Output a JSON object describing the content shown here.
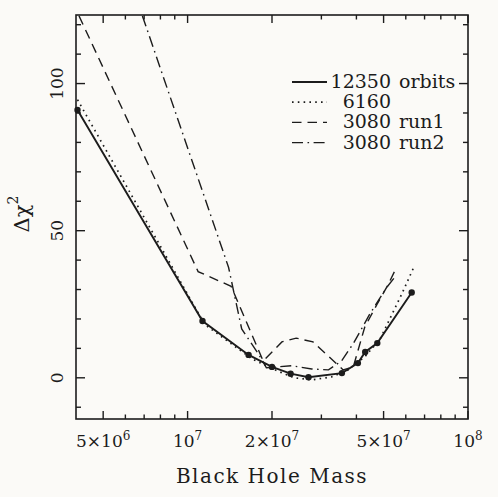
{
  "figure": {
    "background": "#fbfaf7",
    "ink": "#1c1c1c",
    "width": 498,
    "height": 497
  },
  "chart_data": {
    "type": "line",
    "title": "",
    "xlabel": "Black Hole Mass",
    "ylabel": "Δχ^2",
    "x_scale": "log",
    "y_scale": "linear",
    "xlim": [
      4000000,
      100000000
    ],
    "ylim": [
      -14,
      123.3
    ],
    "grid": false,
    "legend_position": "top-right",
    "x_ticks": [
      {
        "v": 5000000,
        "label": "5×10^6"
      },
      {
        "v": 6000000,
        "label": ""
      },
      {
        "v": 7000000,
        "label": ""
      },
      {
        "v": 8000000,
        "label": ""
      },
      {
        "v": 9000000,
        "label": ""
      },
      {
        "v": 10000000,
        "label": "10^7"
      },
      {
        "v": 20000000,
        "label": "2×10^7"
      },
      {
        "v": 30000000,
        "label": ""
      },
      {
        "v": 40000000,
        "label": ""
      },
      {
        "v": 50000000,
        "label": "5×10^7"
      },
      {
        "v": 60000000,
        "label": ""
      },
      {
        "v": 70000000,
        "label": ""
      },
      {
        "v": 80000000,
        "label": ""
      },
      {
        "v": 90000000,
        "label": ""
      },
      {
        "v": 100000000,
        "label": "10^8"
      }
    ],
    "y_ticks_major": [
      {
        "v": 0,
        "label": "0"
      },
      {
        "v": 50,
        "label": "50"
      },
      {
        "v": 100,
        "label": "100"
      }
    ],
    "y_ticks_minor": [
      -10,
      10,
      20,
      30,
      40,
      60,
      70,
      80,
      90,
      110,
      120
    ],
    "series": [
      {
        "name": "12350 orbits",
        "legend_num": "12350",
        "legend_suffix": "orbits",
        "style": "solid",
        "marker": "circle",
        "x": [
          4050000,
          11300000,
          16500000,
          20000000,
          23300000,
          27000000,
          35500000,
          40500000,
          43000000,
          47500000,
          63000000
        ],
        "y": [
          91,
          19.3,
          7.8,
          3.7,
          1.4,
          0.2,
          1.6,
          5.0,
          8.8,
          11.8,
          29
        ]
      },
      {
        "name": "6160",
        "legend_num": "6160",
        "legend_suffix": "",
        "style": "dotted",
        "marker": "none",
        "x": [
          4050000,
          11500000,
          17000000,
          20800000,
          24000000,
          27700000,
          32600000,
          37000000,
          42800000,
          48600000,
          58000000,
          64500000
        ],
        "y": [
          94.5,
          18.2,
          6.4,
          2.4,
          0.0,
          -0.7,
          0.3,
          2.4,
          7.1,
          13.2,
          28.4,
          38.2
        ]
      },
      {
        "name": "3080 run1",
        "legend_num": "3080",
        "legend_suffix": "run1",
        "style": "dashed",
        "marker": "none",
        "x": [
          4100000,
          10900000,
          14300000,
          18600000,
          21700000,
          24400000,
          28000000,
          35900000,
          39000000,
          42800000,
          47400000,
          51700000,
          55600000
        ],
        "y": [
          123,
          36.1,
          31.1,
          5.7,
          12.2,
          13.5,
          12.2,
          2.7,
          3.7,
          17.2,
          25.0,
          31.4,
          37.5
        ]
      },
      {
        "name": "3080 run2",
        "legend_num": "3080",
        "legend_suffix": "run2",
        "style": "dashdot",
        "marker": "none",
        "x": [
          6900000,
          14000000,
          15600000,
          17900000,
          19100000,
          23500000,
          27700000,
          31800000,
          35400000,
          39100000,
          44600000,
          51300000,
          54700000
        ],
        "y": [
          123,
          37.5,
          16.6,
          8.1,
          3.4,
          4.1,
          3.0,
          2.7,
          5.7,
          11.8,
          21.6,
          30.7,
          34.1
        ]
      }
    ]
  }
}
